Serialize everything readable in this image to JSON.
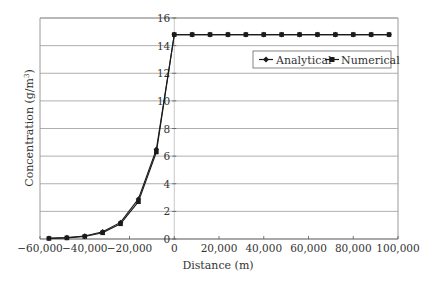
{
  "chart_data": {
    "type": "line",
    "title": "",
    "xlabel": "Distance (m)",
    "ylabel": "Concentration (g/m3)",
    "ylabel_parts": {
      "main": "Concentration (g/m",
      "sup": "3",
      "tail": ")"
    },
    "xlim": [
      -60000,
      100000
    ],
    "ylim": [
      0,
      16
    ],
    "xticks": [
      -60000,
      -40000,
      -20000,
      0,
      20000,
      40000,
      60000,
      80000,
      100000
    ],
    "xtick_labels": [
      "−60,000",
      "−40,000",
      "−20,000",
      "0",
      "20,000",
      "40,000",
      "60,000",
      "80,000",
      "100,000"
    ],
    "yticks": [
      0,
      2,
      4,
      6,
      8,
      10,
      12,
      14,
      16
    ],
    "ytick_labels": [
      "0",
      "2",
      "4",
      "6",
      "8",
      "10",
      "12",
      "14",
      "16"
    ],
    "grid": {
      "horizontal": true,
      "vertical": false
    },
    "legend_position": "upper right",
    "x": [
      -56000,
      -48000,
      -40000,
      -32000,
      -24000,
      -16000,
      -8000,
      0,
      8000,
      16000,
      24000,
      32000,
      40000,
      48000,
      56000,
      64000,
      72000,
      80000,
      88000,
      96000
    ],
    "series": [
      {
        "name": "Analytical",
        "marker": "diamond",
        "color": "#1a1a1a",
        "values": [
          0.05,
          0.1,
          0.22,
          0.52,
          1.2,
          2.9,
          6.5,
          14.8,
          14.8,
          14.8,
          14.8,
          14.8,
          14.8,
          14.8,
          14.8,
          14.8,
          14.8,
          14.8,
          14.8,
          14.8
        ]
      },
      {
        "name": "Numerical",
        "marker": "square",
        "color": "#1a1a1a",
        "values": [
          0.04,
          0.08,
          0.18,
          0.45,
          1.1,
          2.7,
          6.3,
          14.8,
          14.8,
          14.8,
          14.8,
          14.8,
          14.8,
          14.8,
          14.8,
          14.8,
          14.8,
          14.8,
          14.8,
          14.8
        ]
      }
    ]
  },
  "colors": {
    "grid": "#9a9a9a",
    "axis": "#555555",
    "zero_line": "#c8c8c8",
    "series": "#1a1a1a"
  }
}
